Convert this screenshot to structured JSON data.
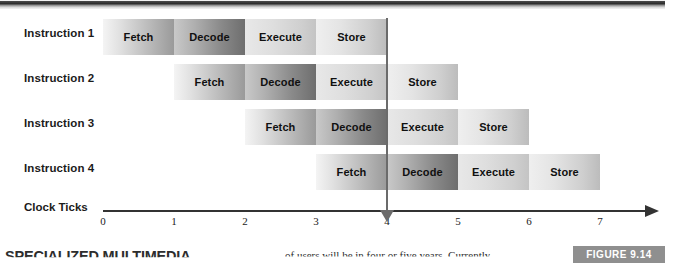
{
  "figure": {
    "badge_label": "FIGURE 9.14",
    "badge_color": "#8f8f8f"
  },
  "diagram": {
    "axis_label": "Clock Ticks",
    "rows": [
      {
        "label": "Instruction 1",
        "start_tick": 0,
        "stages": [
          {
            "name": "Fetch",
            "type": "fetch"
          },
          {
            "name": "Decode",
            "type": "decode"
          },
          {
            "name": "Execute",
            "type": "execute"
          },
          {
            "name": "Store",
            "type": "store"
          }
        ]
      },
      {
        "label": "Instruction 2",
        "start_tick": 1,
        "stages": [
          {
            "name": "Fetch",
            "type": "fetch"
          },
          {
            "name": "Decode",
            "type": "decode"
          },
          {
            "name": "Execute",
            "type": "execute"
          },
          {
            "name": "Store",
            "type": "store"
          }
        ]
      },
      {
        "label": "Instruction 3",
        "start_tick": 2,
        "stages": [
          {
            "name": "Fetch",
            "type": "fetch"
          },
          {
            "name": "Decode",
            "type": "decode"
          },
          {
            "name": "Execute",
            "type": "execute"
          },
          {
            "name": "Store",
            "type": "store"
          }
        ]
      },
      {
        "label": "Instruction 4",
        "start_tick": 3,
        "stages": [
          {
            "name": "Fetch",
            "type": "fetch"
          },
          {
            "name": "Decode",
            "type": "decode"
          },
          {
            "name": "Execute",
            "type": "execute"
          },
          {
            "name": "Store",
            "type": "store"
          }
        ]
      }
    ],
    "ticks": [
      "0",
      "1",
      "2",
      "3",
      "4",
      "5",
      "6",
      "7"
    ],
    "marker_tick": 4
  },
  "chart_data": {
    "type": "bar",
    "xlabel": "Clock Ticks",
    "ylabel": "",
    "categories": [
      "Instruction 1",
      "Instruction 2",
      "Instruction 3",
      "Instruction 4"
    ],
    "stage_names": [
      "Fetch",
      "Decode",
      "Execute",
      "Store"
    ],
    "xlim": [
      0,
      7.7
    ],
    "tick_labels": [
      "0",
      "1",
      "2",
      "3",
      "4",
      "5",
      "6",
      "7"
    ],
    "grid": false,
    "legend": "none",
    "annotations": [
      {
        "label": "marker line at clock tick 4",
        "x": 4
      }
    ],
    "series": [
      {
        "name": "Instruction 1",
        "stage_spans": [
          [
            0,
            1
          ],
          [
            1,
            2
          ],
          [
            2,
            3
          ],
          [
            3,
            4
          ]
        ]
      },
      {
        "name": "Instruction 2",
        "stage_spans": [
          [
            1,
            2
          ],
          [
            2,
            3
          ],
          [
            3,
            4
          ],
          [
            4,
            5
          ]
        ]
      },
      {
        "name": "Instruction 3",
        "stage_spans": [
          [
            2,
            3
          ],
          [
            3,
            4
          ],
          [
            4,
            5
          ],
          [
            5,
            6
          ]
        ]
      },
      {
        "name": "Instruction 4",
        "stage_spans": [
          [
            3,
            4
          ],
          [
            4,
            5
          ],
          [
            5,
            6
          ],
          [
            6,
            7
          ]
        ]
      }
    ]
  },
  "page_text": {
    "left_column_heading": "SPECIALIZED MULTIMEDIA",
    "middle_column_text": "of users will be in four or five years. Currently"
  }
}
